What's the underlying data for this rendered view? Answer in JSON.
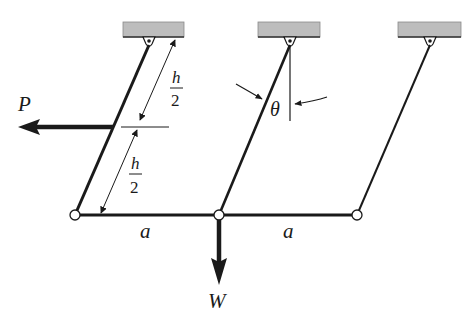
{
  "diagram": {
    "type": "mechanism",
    "colors": {
      "ink": "#1a1a1a",
      "support_fill": "#bdbdbd",
      "background": "#ffffff"
    },
    "supports": [
      {
        "id": "left",
        "pin_x": 149,
        "pin_y": 42
      },
      {
        "id": "middle",
        "pin_x": 290,
        "pin_y": 42
      },
      {
        "id": "right",
        "pin_x": 430,
        "pin_y": 42
      }
    ],
    "nodes": [
      {
        "id": "A",
        "x": 75,
        "y": 215
      },
      {
        "id": "B",
        "x": 219,
        "y": 215
      },
      {
        "id": "C",
        "x": 357,
        "y": 215
      }
    ],
    "labels": {
      "force_p": "P",
      "force_w": "W",
      "angle": "θ",
      "span_left": "a",
      "span_right": "a",
      "half_height_num": "h",
      "half_height_den": "2"
    }
  }
}
